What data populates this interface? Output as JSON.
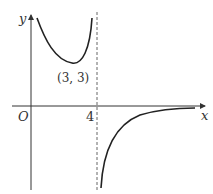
{
  "graph": {
    "y_label": "y",
    "x_label": "x",
    "origin_label": "O",
    "asymptote_label": "4",
    "minimum_point_label": "(3, 3)",
    "asymptote_x": 4,
    "minimum_point": [
      3,
      3
    ],
    "colors": {
      "curve": "#222222",
      "axes": "#333333",
      "asymptote": "#666666"
    }
  }
}
